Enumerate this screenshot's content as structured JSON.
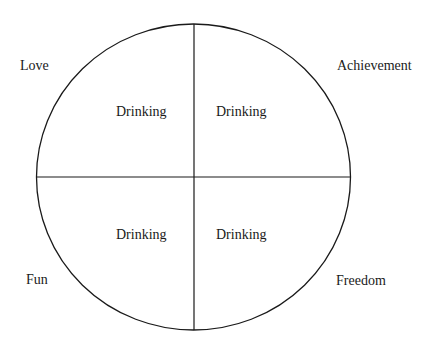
{
  "diagram": {
    "type": "quadrant-circle",
    "corner_labels": {
      "top_left": "Love",
      "top_right": "Achievement",
      "bottom_left": "Fun",
      "bottom_right": "Freedom"
    },
    "quadrants": {
      "top_left": "Drinking",
      "top_right": "Drinking",
      "bottom_left": "Drinking",
      "bottom_right": "Drinking"
    },
    "colors": {
      "line": "#1a1a1a",
      "background": "#ffffff"
    }
  }
}
